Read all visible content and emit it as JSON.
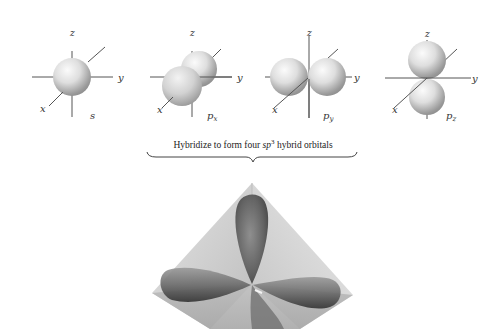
{
  "figure": {
    "orbitals": [
      {
        "id": "s",
        "label": "s",
        "sub": "",
        "axes": {
          "z": "z",
          "y": "y",
          "x": "x"
        }
      },
      {
        "id": "px",
        "label": "p",
        "sub": "x",
        "axes": {
          "z": "z",
          "y": "y",
          "x": "x"
        }
      },
      {
        "id": "py",
        "label": "p",
        "sub": "y",
        "axes": {
          "z": "z",
          "y": "y",
          "x": "x"
        }
      },
      {
        "id": "pz",
        "label": "p",
        "sub": "z",
        "axes": {
          "z": "z",
          "y": "y",
          "x": "x"
        }
      }
    ],
    "caption": {
      "before": "Hybridize to form four ",
      "sp": "sp",
      "sup": "3",
      "after": " hybrid orbitals"
    },
    "hybrid": {
      "name": "sp3 tetrahedral hybrid orbitals",
      "lobes": 4
    },
    "colors": {
      "axis": "#555555",
      "sphere_light": "#f4f4f4",
      "sphere_dark": "#8a8a8a",
      "lobe_dark": "#3c3c3c",
      "tetra_face": "#c9c9c9"
    }
  }
}
